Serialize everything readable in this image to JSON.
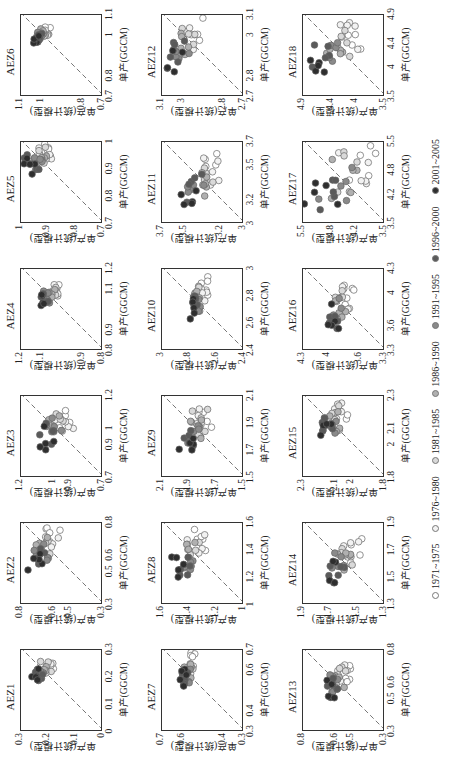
{
  "chart_data": {
    "type": "scatter",
    "title": "",
    "layout": {
      "rows": 3,
      "cols": 6,
      "rotation_deg": -90,
      "diagonal_reference_line": "dashed 1:1"
    },
    "xlabel": "单产(GGCM)",
    "ylabel": "单产(统计模型)",
    "legend": [
      {
        "label": "1971~1975",
        "fill": "#ffffff"
      },
      {
        "label": "1976~1980",
        "fill": "#f2f2f2"
      },
      {
        "label": "1981~1985",
        "fill": "#d9d9d9"
      },
      {
        "label": "1986~1990",
        "fill": "#b0b0b0"
      },
      {
        "label": "1991~1995",
        "fill": "#8a8a8a"
      },
      {
        "label": "1996~2000",
        "fill": "#5a5a5a"
      },
      {
        "label": "2001~2005",
        "fill": "#2e2e2e"
      }
    ],
    "panels": [
      {
        "title": "AEZ1",
        "lim": [
          0,
          0.3
        ],
        "ticks": [
          "0",
          "0.1",
          "0.2",
          "0.3"
        ],
        "x_range": [
          0.17,
          0.27
        ],
        "y_range": [
          0.17,
          0.27
        ],
        "trend": "near 1:1"
      },
      {
        "title": "AEZ2",
        "lim": [
          0.3,
          0.8
        ],
        "ticks": [
          "0.3",
          "0.5",
          "0.6",
          "0.8"
        ],
        "x_range": [
          0.5,
          0.78
        ],
        "y_range": [
          0.55,
          0.78
        ],
        "trend": "above 1:1 for early years"
      },
      {
        "title": "AEZ3",
        "lim": [
          0.7,
          1.2
        ],
        "ticks": [
          "0.7",
          "0.9",
          "1",
          "1.2"
        ],
        "x_range": [
          0.85,
          1.15
        ],
        "y_range": [
          0.85,
          1.12
        ],
        "trend": "scattered around 1:1"
      },
      {
        "title": "AEZ4",
        "lim": [
          0.8,
          1.2
        ],
        "ticks": [
          "0.8",
          "0.9",
          "1.1",
          "1.2"
        ],
        "x_range": [
          1.0,
          1.13
        ],
        "y_range": [
          1.0,
          1.12
        ],
        "trend": "near 1:1"
      },
      {
        "title": "AEZ5",
        "lim": [
          0.7,
          1.0
        ],
        "ticks": [
          "0.7",
          "0.8",
          "0.9",
          "1"
        ],
        "x_range": [
          0.87,
          1.0
        ],
        "y_range": [
          0.87,
          1.0
        ],
        "trend": "near 1:1"
      },
      {
        "title": "AEZ6",
        "lim": [
          0.7,
          1.1
        ],
        "ticks": [
          "0.7",
          "0.8",
          "1",
          "1.1"
        ],
        "x_range": [
          0.95,
          1.05
        ],
        "y_range": [
          0.95,
          1.05
        ],
        "trend": "tight on 1:1"
      },
      {
        "title": "AEZ7",
        "lim": [
          0.3,
          0.7
        ],
        "ticks": [
          "0.3",
          "0.4",
          "0.6",
          "0.7"
        ],
        "x_range": [
          0.5,
          0.68
        ],
        "y_range": [
          0.53,
          0.62
        ],
        "trend": "flat in y"
      },
      {
        "title": "AEZ8",
        "lim": [
          1.0,
          1.6
        ],
        "ticks": [
          "1",
          "1.2",
          "1.4",
          "1.6"
        ],
        "x_range": [
          1.15,
          1.55
        ],
        "y_range": [
          1.25,
          1.55
        ],
        "trend": "flat in y"
      },
      {
        "title": "AEZ9",
        "lim": [
          1.5,
          2.1
        ],
        "ticks": [
          "1.5",
          "1.7",
          "1.9",
          "2.1"
        ],
        "x_range": [
          1.65,
          2.05
        ],
        "y_range": [
          1.72,
          1.98
        ],
        "trend": "flat in y"
      },
      {
        "title": "AEZ10",
        "lim": [
          2.4,
          3.0
        ],
        "ticks": [
          "2.4",
          "2.6",
          "2.8",
          "3"
        ],
        "x_range": [
          2.58,
          2.95
        ],
        "y_range": [
          2.65,
          2.82
        ],
        "trend": "flat in y"
      },
      {
        "title": "AEZ11",
        "lim": [
          3.0,
          3.7
        ],
        "ticks": [
          "3",
          "3.2",
          "3.5",
          "3.7"
        ],
        "x_range": [
          3.1,
          3.62
        ],
        "y_range": [
          3.18,
          3.55
        ],
        "trend": "around 1:1"
      },
      {
        "title": "AEZ12",
        "lim": [
          2.7,
          3.1
        ],
        "ticks": [
          "2.7",
          "2.8",
          "3",
          "3.1"
        ],
        "x_range": [
          2.8,
          3.08
        ],
        "y_range": [
          2.9,
          3.08
        ],
        "trend": "flat in y"
      },
      {
        "title": "AEZ13",
        "lim": [
          0.3,
          0.8
        ],
        "ticks": [
          "0.3",
          "0.5",
          "0.6",
          "0.8"
        ],
        "x_range": [
          0.48,
          0.72
        ],
        "y_range": [
          0.5,
          0.68
        ],
        "trend": "flat in y"
      },
      {
        "title": "AEZ14",
        "lim": [
          1.3,
          1.9
        ],
        "ticks": [
          "1.3",
          "1.5",
          "1.7",
          "1.9"
        ],
        "x_range": [
          1.43,
          1.78
        ],
        "y_range": [
          1.45,
          1.78
        ],
        "trend": "near 1:1"
      },
      {
        "title": "AEZ15",
        "lim": [
          1.8,
          2.3
        ],
        "ticks": [
          "1.8",
          "2",
          "2.1",
          "2.3"
        ],
        "x_range": [
          1.98,
          2.28
        ],
        "y_range": [
          2.02,
          2.22
        ],
        "trend": "flat in y"
      },
      {
        "title": "AEZ16",
        "lim": [
          3.3,
          4.3
        ],
        "ticks": [
          "3.3",
          "3.6",
          "4",
          "4.3"
        ],
        "x_range": [
          3.5,
          4.15
        ],
        "y_range": [
          3.65,
          4.05
        ],
        "trend": "flat in y"
      },
      {
        "title": "AEZ17",
        "lim": [
          3.5,
          5.5
        ],
        "ticks": [
          "3.5",
          "4.2",
          "4.8",
          "5.5"
        ],
        "x_range": [
          3.6,
          5.5
        ],
        "y_range": [
          3.6,
          5.5
        ],
        "trend": "tight on 1:1"
      },
      {
        "title": "AEZ18",
        "lim": [
          3.5,
          4.9
        ],
        "ticks": [
          "3.5",
          "4",
          "4.4",
          "4.9"
        ],
        "x_range": [
          3.8,
          4.85
        ],
        "y_range": [
          3.85,
          4.85
        ],
        "trend": "near 1:1"
      }
    ]
  }
}
